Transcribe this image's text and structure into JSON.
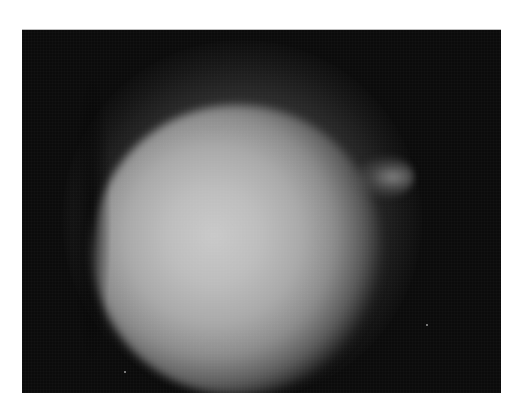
{
  "image": {
    "description": "Grayscale photograph of a bright diffuse circular glow on a black background",
    "colors": {
      "background": "#0b0b0b",
      "glow_center": "#c9c9c9",
      "page": "#ffffff"
    },
    "specks": [
      {
        "x": 426,
        "y": 323
      },
      {
        "x": 124,
        "y": 370
      }
    ]
  }
}
